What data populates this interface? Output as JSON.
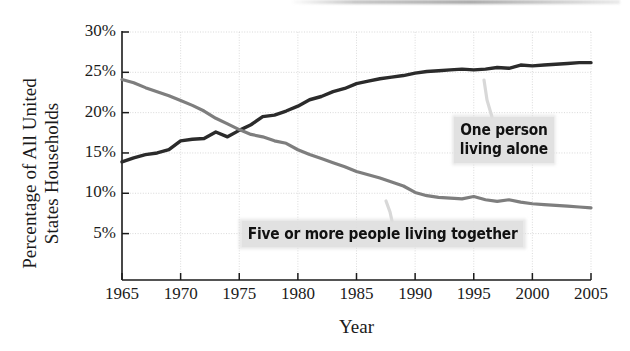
{
  "chart_data": {
    "type": "line",
    "title": "",
    "xlabel": "Year",
    "ylabel": "Percentage of All United States Households",
    "ylabel_line1": "Percentage of All United",
    "ylabel_line2": "States Households",
    "xlim": [
      1965,
      2005
    ],
    "ylim": [
      0,
      30
    ],
    "yticks": [
      30,
      25,
      20,
      15,
      10,
      5
    ],
    "ytick_labels": [
      "30%",
      "25%",
      "20%",
      "15%",
      "10%",
      "5%"
    ],
    "xticks": [
      1965,
      1970,
      1975,
      1980,
      1985,
      1990,
      1995,
      2000,
      2005
    ],
    "xtick_labels": [
      "1965",
      "1970",
      "1975",
      "1980",
      "1985",
      "1990",
      "1995",
      "2000",
      "2005"
    ],
    "grid": true,
    "grid_style": "dotted",
    "legend": "annotations-on-plot",
    "annotations": [
      {
        "text": "One person living alone",
        "line1": "One person",
        "line2": "living alone",
        "series": "one_person"
      },
      {
        "text": "Five or more people living together",
        "series": "five_or_more"
      }
    ],
    "x": [
      1965,
      1966,
      1967,
      1968,
      1969,
      1970,
      1971,
      1972,
      1973,
      1974,
      1975,
      1976,
      1977,
      1978,
      1979,
      1980,
      1981,
      1982,
      1983,
      1984,
      1985,
      1986,
      1987,
      1988,
      1989,
      1990,
      1991,
      1992,
      1993,
      1994,
      1995,
      1996,
      1997,
      1998,
      1999,
      2000,
      2001,
      2002,
      2003,
      2004,
      2005
    ],
    "series": [
      {
        "name": "One person living alone",
        "color": "#2b2b2b",
        "values": [
          13.9,
          14.4,
          14.8,
          15.0,
          15.4,
          16.5,
          16.7,
          16.8,
          17.6,
          17.0,
          17.8,
          18.5,
          19.5,
          19.7,
          20.2,
          20.8,
          21.6,
          22.0,
          22.6,
          23.0,
          23.6,
          23.9,
          24.2,
          24.4,
          24.6,
          24.9,
          25.1,
          25.2,
          25.3,
          25.4,
          25.3,
          25.4,
          25.6,
          25.5,
          25.9,
          25.8,
          25.9,
          26.0,
          26.1,
          26.2,
          26.2
        ]
      },
      {
        "name": "Five or more people living together",
        "color": "#7e7e7e",
        "values": [
          24.1,
          23.7,
          23.1,
          22.6,
          22.1,
          21.5,
          20.9,
          20.2,
          19.3,
          18.6,
          17.9,
          17.3,
          17.0,
          16.5,
          16.2,
          15.4,
          14.8,
          14.3,
          13.8,
          13.3,
          12.7,
          12.3,
          11.9,
          11.4,
          10.9,
          10.1,
          9.7,
          9.5,
          9.4,
          9.3,
          9.6,
          9.2,
          9.0,
          9.2,
          8.9,
          8.7,
          8.6,
          8.5,
          8.4,
          8.3,
          8.2
        ]
      }
    ]
  }
}
